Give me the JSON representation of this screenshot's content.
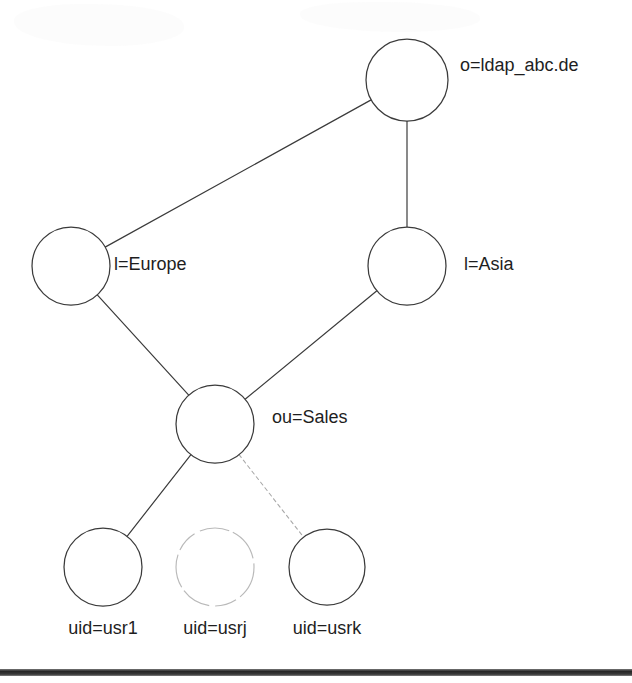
{
  "diagram": {
    "type": "tree-graph",
    "canvas": {
      "width": 632,
      "height": 683,
      "background": "#ffffff"
    },
    "colors": {
      "node_stroke": "#3b3b3b",
      "node_fill": "#ffffff",
      "edge_stroke": "#3b3b3b",
      "faded_stroke": "#b9b9b9",
      "text": "#1e1e1e",
      "page_bar": "#161616"
    },
    "nodes": [
      {
        "id": "root",
        "label": "o=ldap_abc.de",
        "cx": 407,
        "cy": 80,
        "r": 41,
        "label_x": 460,
        "label_y": 66,
        "label_anchor": "start",
        "style": "solid"
      },
      {
        "id": "europe",
        "label": "l=Europe",
        "cx": 71,
        "cy": 266,
        "r": 39,
        "label_x": 114,
        "label_y": 265,
        "label_anchor": "start",
        "style": "solid"
      },
      {
        "id": "asia",
        "label": "l=Asia",
        "cx": 407,
        "cy": 266,
        "r": 39,
        "label_x": 464,
        "label_y": 265,
        "label_anchor": "start",
        "style": "solid"
      },
      {
        "id": "sales",
        "label": "ou=Sales",
        "cx": 215,
        "cy": 424,
        "r": 39,
        "label_x": 272,
        "label_y": 418,
        "label_anchor": "start",
        "style": "solid"
      },
      {
        "id": "usr1",
        "label": "uid=usr1",
        "cx": 103,
        "cy": 567,
        "r": 39,
        "label_x": 103,
        "label_y": 629,
        "label_anchor": "middle",
        "style": "solid"
      },
      {
        "id": "usrj",
        "label": "uid=usrj",
        "cx": 215,
        "cy": 567,
        "r": 39,
        "label_x": 215,
        "label_y": 629,
        "label_anchor": "middle",
        "style": "faded"
      },
      {
        "id": "usrk",
        "label": "uid=usrk",
        "cx": 327,
        "cy": 567,
        "r": 38,
        "label_x": 327,
        "label_y": 629,
        "label_anchor": "middle",
        "style": "solid"
      }
    ],
    "edges": [
      {
        "id": "root-europe",
        "from": "root",
        "to": "europe",
        "style": "solid"
      },
      {
        "id": "root-asia",
        "from": "root",
        "to": "asia",
        "style": "solid"
      },
      {
        "id": "europe-sales",
        "from": "europe",
        "to": "sales",
        "style": "solid"
      },
      {
        "id": "asia-sales",
        "from": "asia",
        "to": "sales",
        "style": "solid"
      },
      {
        "id": "sales-usr1",
        "from": "sales",
        "to": "usr1",
        "style": "solid"
      },
      {
        "id": "sales-usrk",
        "from": "sales",
        "to": "usrk",
        "style": "faint"
      }
    ],
    "page_bar": {
      "x": 0,
      "y": 669,
      "width": 632,
      "height": 7
    }
  }
}
